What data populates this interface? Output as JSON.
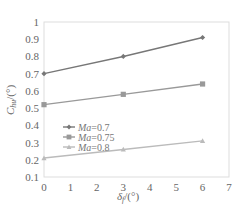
{
  "chart_data": {
    "type": "line",
    "title": "",
    "xlabel": "δ_f/(°)",
    "ylabel": "C_hu/(°)",
    "xlim": [
      0,
      7
    ],
    "ylim": [
      0.1,
      1.0
    ],
    "xticks": [
      "0",
      "1",
      "2",
      "3",
      "4",
      "5",
      "6",
      "7"
    ],
    "yticks": [
      "0.1",
      "0.2",
      "0.3",
      "0.4",
      "0.5",
      "0.6",
      "0.7",
      "0.8",
      "0.9",
      "1"
    ],
    "grid": false,
    "legend_position": "inside-left-middle",
    "x": [
      0,
      3,
      6
    ],
    "series": [
      {
        "name": "Ma=0.7",
        "values": [
          0.7,
          0.8,
          0.91
        ],
        "color": "#777777",
        "marker": "diamond"
      },
      {
        "name": "Ma=0.75",
        "values": [
          0.52,
          0.58,
          0.64
        ],
        "color": "#999999",
        "marker": "square"
      },
      {
        "name": "Ma=0.8",
        "values": [
          0.21,
          0.26,
          0.31
        ],
        "color": "#bbbbbb",
        "marker": "triangle"
      }
    ]
  },
  "legend": {
    "items": [
      {
        "prefix": "Ma",
        "suffix": "=0.7"
      },
      {
        "prefix": "Ma",
        "suffix": "=0.75"
      },
      {
        "prefix": "Ma",
        "suffix": "=0.8"
      }
    ]
  },
  "axes": {
    "x_label_main": "δ",
    "x_label_sub": "f",
    "x_label_unit": "/(°)",
    "y_label_main": "C",
    "y_label_sub": "hu",
    "y_label_unit": "/(°)"
  }
}
